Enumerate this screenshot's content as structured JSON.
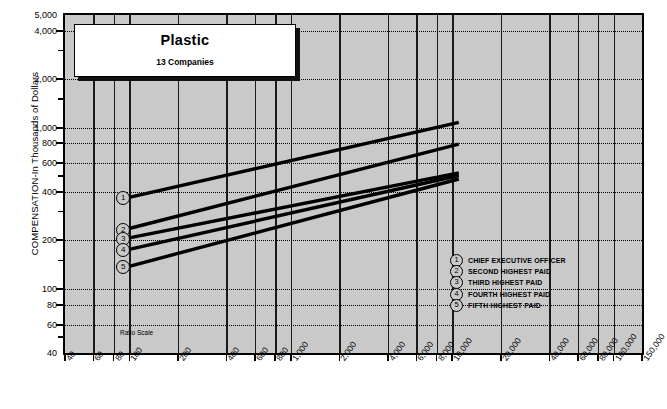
{
  "chart_data": {
    "type": "line",
    "title": "Plastic",
    "subtitle": "13 Companies",
    "note": "Ratio Scale",
    "xlabel": "",
    "ylabel": "COMPENSATION-In Thousands of Dollars",
    "xscale": "log",
    "yscale": "log",
    "xlim": [
      40,
      150000
    ],
    "ylim": [
      40,
      5000
    ],
    "grid": true,
    "legend_position": "inside-right",
    "y_ticks": [
      {
        "value": 5000,
        "label": "5,000",
        "major": true
      },
      {
        "value": 4000,
        "label": "4,000",
        "major": true
      },
      {
        "value": 3000,
        "label": "",
        "major": false
      },
      {
        "value": 2000,
        "label": "2,000",
        "major": true
      },
      {
        "value": 1500,
        "label": "",
        "major": false
      },
      {
        "value": 1000,
        "label": "1,000",
        "major": true
      },
      {
        "value": 800,
        "label": "800",
        "major": true
      },
      {
        "value": 600,
        "label": "600",
        "major": true
      },
      {
        "value": 500,
        "label": "",
        "major": false
      },
      {
        "value": 400,
        "label": "400",
        "major": true
      },
      {
        "value": 300,
        "label": "",
        "major": false
      },
      {
        "value": 200,
        "label": "200",
        "major": true
      },
      {
        "value": 150,
        "label": "",
        "major": false
      },
      {
        "value": 100,
        "label": "100",
        "major": true
      },
      {
        "value": 80,
        "label": "80",
        "major": true
      },
      {
        "value": 60,
        "label": "60",
        "major": true
      },
      {
        "value": 50,
        "label": "",
        "major": false
      },
      {
        "value": 40,
        "label": "40",
        "major": true
      }
    ],
    "x_ticks": [
      {
        "value": 40,
        "label": "40",
        "major": true
      },
      {
        "value": 60,
        "label": "60",
        "major": true
      },
      {
        "value": 80,
        "label": "80",
        "major": true
      },
      {
        "value": 100,
        "label": "100",
        "major": true
      },
      {
        "value": 200,
        "label": "200",
        "major": true
      },
      {
        "value": 400,
        "label": "400",
        "major": true
      },
      {
        "value": 600,
        "label": "600",
        "major": true
      },
      {
        "value": 800,
        "label": "800",
        "major": true
      },
      {
        "value": 1000,
        "label": "1,000",
        "major": true
      },
      {
        "value": 2000,
        "label": "2,000",
        "major": true
      },
      {
        "value": 4000,
        "label": "4,000",
        "major": true
      },
      {
        "value": 6000,
        "label": "6,000",
        "major": true
      },
      {
        "value": 8000,
        "label": "8,000",
        "major": true
      },
      {
        "value": 10000,
        "label": "10,000",
        "major": true
      },
      {
        "value": 20000,
        "label": "20,000",
        "major": true
      },
      {
        "value": 40000,
        "label": "40,000",
        "major": true
      },
      {
        "value": 60000,
        "label": "60,000",
        "major": true
      },
      {
        "value": 80000,
        "label": "80,000",
        "major": true
      },
      {
        "value": 100000,
        "label": "100,000",
        "major": true
      },
      {
        "value": 150000,
        "label": "150,000",
        "major": true
      }
    ],
    "series": [
      {
        "id": 1,
        "marker": "1",
        "name": "CHIEF EXECUTIVE OFFICER",
        "points": [
          [
            100,
            370
          ],
          [
            11000,
            1080
          ]
        ]
      },
      {
        "id": 2,
        "marker": "2",
        "name": "SECOND HIGHEST PAID",
        "points": [
          [
            100,
            237
          ],
          [
            11000,
            790
          ]
        ]
      },
      {
        "id": 3,
        "marker": "3",
        "name": "THIRD HIGHEST PAID",
        "points": [
          [
            100,
            207
          ],
          [
            11000,
            525
          ]
        ]
      },
      {
        "id": 4,
        "marker": "4",
        "name": "FOURTH HIGHEST PAID",
        "points": [
          [
            100,
            176
          ],
          [
            11000,
            505
          ]
        ]
      },
      {
        "id": 5,
        "marker": "5",
        "name": "FIFTH HIGHEST PAID",
        "points": [
          [
            100,
            138
          ],
          [
            11000,
            480
          ]
        ]
      }
    ],
    "legend": [
      {
        "marker": "1",
        "label": "CHIEF EXECUTIVE OFFICER"
      },
      {
        "marker": "2",
        "label": "SECOND HIGHEST PAID"
      },
      {
        "marker": "3",
        "label": "THIRD HIGHEST PAID"
      },
      {
        "marker": "4",
        "label": "FOURTH HIGHEST PAID"
      },
      {
        "marker": "5",
        "label": "FIFTH HIGHEST PAID"
      }
    ]
  }
}
